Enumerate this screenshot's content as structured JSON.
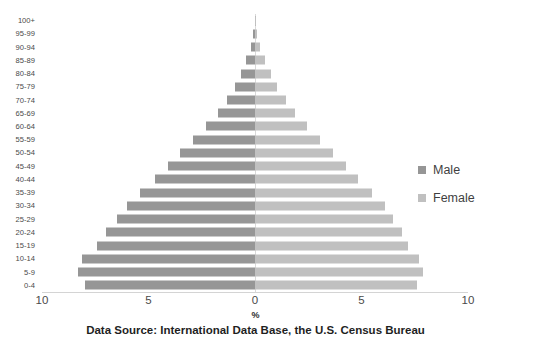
{
  "chart_data": {
    "type": "bar",
    "subtype": "population-pyramid",
    "title": "",
    "xlabel": "%",
    "ylabel": "",
    "caption": "Data Source: International Data Base, the U.S. Census Bureau",
    "xlim": [
      -10,
      10
    ],
    "xticks": [
      -10,
      -5,
      0,
      5,
      10
    ],
    "xtick_labels": [
      "10",
      "5",
      "0",
      "5",
      "10"
    ],
    "grid": false,
    "legend_position": "right",
    "orientation": "horizontal",
    "categories": [
      "100+",
      "95-99",
      "90-94",
      "85-89",
      "80-84",
      "75-79",
      "70-74",
      "65-69",
      "60-64",
      "55-59",
      "50-54",
      "45-49",
      "40-44",
      "35-39",
      "30-34",
      "25-29",
      "20-24",
      "15-19",
      "10-14",
      "5-9",
      "0-4"
    ],
    "series": [
      {
        "name": "Male",
        "color": "#969696",
        "side": "left",
        "values": [
          0.02,
          0.08,
          0.2,
          0.4,
          0.65,
          0.95,
          1.3,
          1.75,
          2.3,
          2.9,
          3.5,
          4.1,
          4.7,
          5.4,
          6.0,
          6.5,
          7.0,
          7.4,
          8.1,
          8.3,
          8.0
        ]
      },
      {
        "name": "Female",
        "color": "#c0c0c0",
        "side": "right",
        "values": [
          0.03,
          0.1,
          0.25,
          0.45,
          0.75,
          1.05,
          1.45,
          1.9,
          2.45,
          3.05,
          3.65,
          4.25,
          4.85,
          5.5,
          6.1,
          6.5,
          6.9,
          7.2,
          7.7,
          7.9,
          7.6
        ]
      }
    ]
  },
  "legend": {
    "items": [
      {
        "label": "Male",
        "color": "#969696"
      },
      {
        "label": "Female",
        "color": "#c0c0c0"
      }
    ]
  },
  "axis": {
    "x_title": "%"
  },
  "footer": {
    "source": "Data Source: International Data Base, the U.S. Census Bureau"
  }
}
